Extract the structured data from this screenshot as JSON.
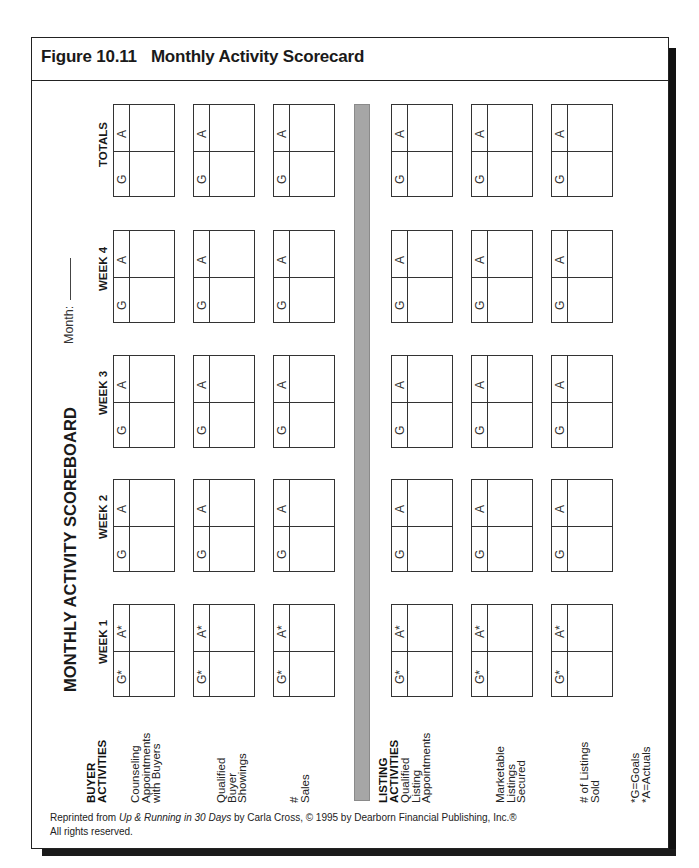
{
  "figure": {
    "number": "Figure 10.11",
    "title": "Monthly Activity Scorecard"
  },
  "scoreboard": {
    "title": "MONTHLY ACTIVITY SCOREBOARD",
    "month_label": "Month:",
    "month_value": ""
  },
  "columns": [
    {
      "label": "WEEK 1",
      "goal_mark": "G*",
      "actual_mark": "A*"
    },
    {
      "label": "WEEK 2",
      "goal_mark": "G",
      "actual_mark": "A"
    },
    {
      "label": "WEEK 3",
      "goal_mark": "G",
      "actual_mark": "A"
    },
    {
      "label": "WEEK 4",
      "goal_mark": "G",
      "actual_mark": "A"
    },
    {
      "label": "TOTALS",
      "goal_mark": "G",
      "actual_mark": "A"
    }
  ],
  "buyer_section": {
    "heading": [
      "BUYER",
      "ACTIVITIES"
    ],
    "activities": [
      {
        "label": [
          "Counseling",
          "Appointments",
          "with Buyers"
        ]
      },
      {
        "label": [
          "Qualified",
          "Buyer",
          "Showings"
        ]
      },
      {
        "label": [
          "#",
          "Sales"
        ]
      }
    ]
  },
  "listing_section": {
    "heading": [
      "LISTING",
      "ACTIVITIES"
    ],
    "activities": [
      {
        "label": [
          "Qualified",
          "Listing",
          "Appointments"
        ]
      },
      {
        "label": [
          "Marketable",
          "Listings",
          "Secured"
        ]
      },
      {
        "label": [
          "# of Listings",
          "Sold"
        ]
      }
    ]
  },
  "legend": [
    "*G=Goals",
    "*A=Actuals"
  ],
  "footer": {
    "prefix": "Reprinted from ",
    "book": "Up & Running in 30 Days",
    "suffix": " by Carla Cross, © 1995 by Dearborn Financial Publishing, Inc.®",
    "line2": "All rights reserved."
  },
  "colors": {
    "divider_bar": "#a6a6a6",
    "frame": "#222222",
    "shadow": "#111111"
  }
}
